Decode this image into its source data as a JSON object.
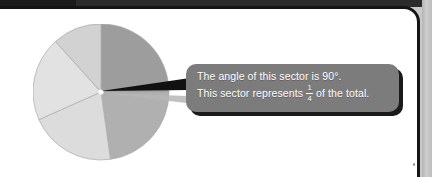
{
  "page": {
    "background_color": "#c9c9c9",
    "sheet_color": "#ffffff",
    "border_color": "#141414"
  },
  "callout": {
    "name": "sector-annotation-callout",
    "background_color": "#7c7c7c",
    "text_color": "#ffffff",
    "line1": "The angle of this sector is 90°.",
    "line2_before": "This sector represents",
    "fraction_numerator": "1",
    "fraction_denominator": "4",
    "line2_after": "of the total."
  },
  "chart_data": {
    "type": "pie",
    "title": "",
    "center": {
      "x": 68,
      "y": 68
    },
    "radius": 68,
    "total_degrees": 360,
    "legend": "none",
    "categories": [
      "Highlighted sector",
      "Sector 2",
      "Sector 3",
      "Sector 4",
      "Sector 5"
    ],
    "values_degrees": [
      90,
      82,
      74,
      72,
      42
    ],
    "values_fraction": [
      "1/4",
      "",
      "",
      "",
      ""
    ],
    "slices": [
      {
        "label": "Highlighted sector",
        "start_deg": 0,
        "end_deg": 90,
        "degrees": 90,
        "fraction": "1/4",
        "color": "#9d9d9d",
        "annotated": true
      },
      {
        "label": "Sector 2",
        "start_deg": 90,
        "end_deg": 172,
        "degrees": 82,
        "fraction": "",
        "color": "#b0b0b0",
        "annotated": false
      },
      {
        "label": "Sector 3",
        "start_deg": 172,
        "end_deg": 246,
        "degrees": 74,
        "fraction": "",
        "color": "#dcdcdc",
        "annotated": false
      },
      {
        "label": "Sector 4",
        "start_deg": 246,
        "end_deg": 318,
        "degrees": 72,
        "fraction": "",
        "color": "#e2e2e2",
        "annotated": false
      },
      {
        "label": "Sector 5",
        "start_deg": 318,
        "end_deg": 360,
        "degrees": 42,
        "fraction": "",
        "color": "#d2d2d2",
        "annotated": false
      }
    ],
    "stroke_color": "#a9a9a9",
    "center_dot_color": "#ffffff"
  }
}
